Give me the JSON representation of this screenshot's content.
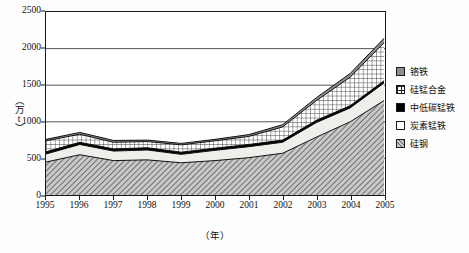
{
  "chart_data": {
    "type": "area",
    "title": "",
    "xlabel": "（年）",
    "ylabel": "（万t）",
    "categories": [
      "1995",
      "1996",
      "1997",
      "1998",
      "1999",
      "2000",
      "2001",
      "2002",
      "2003",
      "2004",
      "2005"
    ],
    "ylim": [
      0,
      2500
    ],
    "y_ticks": [
      0,
      500,
      1000,
      1500,
      2000,
      2500
    ],
    "grid": true,
    "legend_position": "right",
    "stacked": true,
    "stack_order_bottom_to_top": [
      "硅钢",
      "炭素锰铁",
      "中低碳锰铁",
      "硅锰合金",
      "铬铁"
    ],
    "series": [
      {
        "name": "硅钢",
        "values": [
          450,
          550,
          470,
          480,
          440,
          470,
          510,
          570,
          790,
          1000,
          1290
        ]
      },
      {
        "name": "炭素锰铁",
        "values": [
          110,
          140,
          130,
          135,
          115,
          140,
          150,
          150,
          200,
          190,
          240
        ]
      },
      {
        "name": "中低碳锰铁",
        "values": [
          30,
          30,
          30,
          30,
          30,
          30,
          30,
          30,
          30,
          30,
          30
        ]
      },
      {
        "name": "硅锰合金",
        "values": [
          150,
          110,
          90,
          85,
          100,
          100,
          110,
          180,
          270,
          390,
          520
        ]
      },
      {
        "name": "铬铁",
        "values": [
          20,
          25,
          25,
          20,
          20,
          20,
          25,
          30,
          40,
          50,
          60
        ]
      }
    ],
    "cumulative_tops": {
      "硅钢": [
        450,
        550,
        470,
        480,
        440,
        470,
        510,
        570,
        790,
        1000,
        1290
      ],
      "炭素锰铁": [
        560,
        690,
        600,
        615,
        555,
        610,
        660,
        720,
        990,
        1190,
        1530
      ],
      "中低碳锰铁": [
        590,
        720,
        630,
        645,
        585,
        640,
        690,
        750,
        1020,
        1220,
        1560
      ],
      "硅锰合金": [
        740,
        830,
        720,
        730,
        685,
        740,
        800,
        930,
        1290,
        1610,
        2080
      ],
      "铬铁": [
        760,
        855,
        745,
        750,
        705,
        760,
        825,
        960,
        1330,
        1660,
        2140
      ]
    }
  },
  "axes": {
    "y_tick_labels": [
      "2500",
      "2000",
      "1500",
      "1000",
      "500",
      "0"
    ],
    "y_title": "（万t）",
    "x_tick_labels": [
      "1995",
      "1996",
      "1997",
      "1998",
      "1999",
      "2000",
      "2001",
      "2002",
      "2003",
      "2004",
      "2005"
    ],
    "x_title": "（年）"
  },
  "legend": {
    "items": [
      {
        "label": "铬铁",
        "swatch": "gray-solid-swatch"
      },
      {
        "label": "硅锰合金",
        "swatch": "grid-hatch-swatch"
      },
      {
        "label": "中低碳锰铁",
        "swatch": "black-solid-swatch"
      },
      {
        "label": "炭素锰铁",
        "swatch": "white-solid-swatch"
      },
      {
        "label": "硅钢",
        "swatch": "diagonal-hatch-swatch"
      }
    ]
  },
  "colors": {
    "chrome_iron": "#8c8c8c",
    "si_mn_alloy": "#ffffff",
    "low_c_mn_iron": "#000000",
    "carbon_mn_iron": "#f0eeea",
    "silicon_steel": "#c9c9c9",
    "axis": "#1a1a1a",
    "grid": "#555555"
  }
}
